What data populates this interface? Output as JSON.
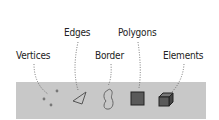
{
  "diagram": {
    "labels": [
      {
        "id": "vertices",
        "text": "Vertices"
      },
      {
        "id": "edges",
        "text": "Edges"
      },
      {
        "id": "border",
        "text": "Border"
      },
      {
        "id": "polygons",
        "text": "Polygons"
      },
      {
        "id": "elements",
        "text": "Elements"
      }
    ],
    "toolbar": {
      "background": "#c8c8c8",
      "icons": [
        "vertices-icon",
        "edges-icon",
        "border-icon",
        "polygons-icon",
        "elements-icon"
      ]
    }
  }
}
